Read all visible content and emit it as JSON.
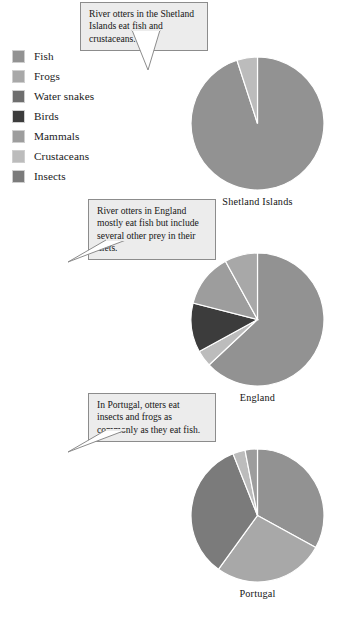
{
  "legend": {
    "items": [
      {
        "label": "Fish",
        "color": "#929292"
      },
      {
        "label": "Frogs",
        "color": "#a8a8a8"
      },
      {
        "label": "Water snakes",
        "color": "#6e6e6e"
      },
      {
        "label": "Birds",
        "color": "#3c3c3c"
      },
      {
        "label": "Mammals",
        "color": "#9d9d9d"
      },
      {
        "label": "Crustaceans",
        "color": "#bcbcbc"
      },
      {
        "label": "Insects",
        "color": "#7b7b7b"
      }
    ]
  },
  "callouts": [
    {
      "id": "shetland",
      "text": "River otters in the Shetland Islands eat fish and crustaceans."
    },
    {
      "id": "england",
      "text": "River otters in England mostly eat fish but include several other prey in their diets."
    },
    {
      "id": "portugal",
      "text": "In Portugal, otters eat insects and frogs as commonly as they eat fish."
    }
  ],
  "chart_data": [
    {
      "type": "pie",
      "title": "Shetland Islands",
      "categories": [
        "Fish",
        "Crustaceans"
      ],
      "values": [
        95,
        5
      ],
      "colors": [
        "#929292",
        "#bcbcbc"
      ],
      "start_angle": 0,
      "legend_position": "left"
    },
    {
      "type": "pie",
      "title": "England",
      "categories": [
        "Fish",
        "Crustaceans",
        "Birds",
        "Mammals",
        "Frogs"
      ],
      "values": [
        63,
        4,
        12,
        13,
        8
      ],
      "colors": [
        "#929292",
        "#bcbcbc",
        "#3c3c3c",
        "#9d9d9d",
        "#a8a8a8"
      ],
      "start_angle": 0,
      "legend_position": "left"
    },
    {
      "type": "pie",
      "title": "Portugal",
      "categories": [
        "Fish",
        "Frogs",
        "Insects",
        "Crustaceans",
        "Mammals"
      ],
      "values": [
        33,
        27,
        34,
        3,
        3
      ],
      "colors": [
        "#929292",
        "#a8a8a8",
        "#7b7b7b",
        "#bcbcbc",
        "#9d9d9d"
      ],
      "start_angle": 0,
      "legend_position": "left"
    }
  ]
}
